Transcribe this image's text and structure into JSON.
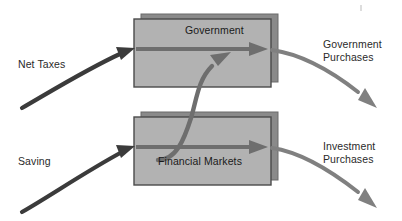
{
  "diagram": {
    "canvas": {
      "width": 402,
      "height": 221,
      "background": "#ffffff"
    },
    "colors": {
      "box_fill": "#b2b2b2",
      "box_border": "#4a4a4a",
      "box_shadow": "#8a8a8a",
      "arrow_dark": "#3b3b3b",
      "arrow_gray": "#808080",
      "arrow_mid": "#6e6e6e",
      "text": "#1a1a1a"
    },
    "boxes": [
      {
        "id": "government",
        "label": "Government",
        "x": 134,
        "y": 19,
        "width": 137,
        "height": 68
      },
      {
        "id": "financial-markets",
        "label": "Financial Markets",
        "x": 134,
        "y": 117,
        "width": 137,
        "height": 68
      }
    ],
    "flows": [
      {
        "id": "net-taxes",
        "label": "Net Taxes",
        "direction": "inbound",
        "target": "government",
        "label_lines": [
          "Net Taxes"
        ]
      },
      {
        "id": "saving",
        "label": "Saving",
        "direction": "inbound",
        "target": "financial-markets",
        "label_lines": [
          "Saving"
        ]
      },
      {
        "id": "government-purchases",
        "label": "Government Purchases",
        "direction": "outbound",
        "source": "government",
        "label_lines": [
          "Government",
          "Purchases"
        ]
      },
      {
        "id": "investment-purchases",
        "label": "Investment Purchases",
        "direction": "outbound",
        "source": "financial-markets",
        "label_lines": [
          "Investment",
          "Purchases"
        ]
      },
      {
        "id": "financial-to-government",
        "label": "",
        "direction": "connector",
        "source": "financial-markets",
        "target": "government",
        "label_lines": []
      }
    ]
  }
}
